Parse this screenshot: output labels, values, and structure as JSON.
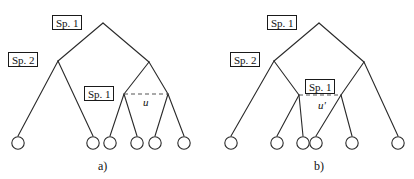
{
  "figure": {
    "background_color": "#ffffff",
    "stroke_color": "#2a2a2a",
    "dash_color": "#555555",
    "width": 414,
    "height": 179
  },
  "panels": [
    {
      "id": "a",
      "caption": "a)",
      "caption_x": 98,
      "caption_y": 160,
      "labels": [
        {
          "name": "sp1-root",
          "text": "Sp. 1",
          "x": 52,
          "y": 15,
          "w": 30,
          "h": 15
        },
        {
          "name": "sp2-left",
          "text": "Sp. 2",
          "x": 8,
          "y": 52,
          "w": 30,
          "h": 15
        },
        {
          "name": "sp1-inner",
          "text": "Sp. 1",
          "x": 84,
          "y": 86,
          "w": 30,
          "h": 15
        }
      ],
      "u_label": {
        "text": "u",
        "x": 143,
        "y": 97
      },
      "dashed_line": {
        "x1": 124,
        "y1": 94,
        "x2": 168,
        "y2": 94
      },
      "nodes": [
        {
          "name": "root",
          "x": 103,
          "y": 23
        },
        {
          "name": "left-internal",
          "x": 58,
          "y": 61
        },
        {
          "name": "right-internal",
          "x": 149,
          "y": 62
        },
        {
          "name": "clade-left",
          "x": 124,
          "y": 94
        },
        {
          "name": "clade-right",
          "x": 168,
          "y": 94
        }
      ],
      "leaves": [
        {
          "name": "leaf-1",
          "x": 18,
          "y": 143
        },
        {
          "name": "leaf-2",
          "x": 93,
          "y": 143
        },
        {
          "name": "leaf-3",
          "x": 110,
          "y": 143
        },
        {
          "name": "leaf-4",
          "x": 137,
          "y": 143
        },
        {
          "name": "leaf-5",
          "x": 155,
          "y": 143
        },
        {
          "name": "leaf-6",
          "x": 184,
          "y": 143
        }
      ],
      "edges": [
        {
          "x1": 103,
          "y1": 23,
          "x2": 58,
          "y2": 61
        },
        {
          "x1": 103,
          "y1": 23,
          "x2": 149,
          "y2": 62
        },
        {
          "x1": 58,
          "y1": 61,
          "x2": 18,
          "y2": 136
        },
        {
          "x1": 58,
          "y1": 61,
          "x2": 93,
          "y2": 136
        },
        {
          "x1": 149,
          "y1": 62,
          "x2": 124,
          "y2": 94
        },
        {
          "x1": 149,
          "y1": 62,
          "x2": 168,
          "y2": 94
        },
        {
          "x1": 124,
          "y1": 94,
          "x2": 110,
          "y2": 136
        },
        {
          "x1": 124,
          "y1": 94,
          "x2": 137,
          "y2": 136
        },
        {
          "x1": 168,
          "y1": 94,
          "x2": 155,
          "y2": 136
        },
        {
          "x1": 168,
          "y1": 94,
          "x2": 184,
          "y2": 136
        }
      ]
    },
    {
      "id": "b",
      "caption": "b)",
      "caption_x": 314,
      "caption_y": 160,
      "labels": [
        {
          "name": "sp1-root",
          "text": "Sp. 1",
          "x": 267,
          "y": 15,
          "w": 30,
          "h": 15
        },
        {
          "name": "sp2-left",
          "text": "Sp. 2",
          "x": 230,
          "y": 52,
          "w": 30,
          "h": 15
        },
        {
          "name": "sp1-inner",
          "text": "Sp. 1",
          "x": 305,
          "y": 79,
          "w": 30,
          "h": 15
        }
      ],
      "u_label": {
        "text": "u'",
        "x": 318,
        "y": 100
      },
      "dashed_line": {
        "x1": 299,
        "y1": 95,
        "x2": 341,
        "y2": 95
      },
      "nodes": [
        {
          "name": "root",
          "x": 319,
          "y": 23
        },
        {
          "name": "left-internal",
          "x": 274,
          "y": 61
        },
        {
          "name": "right-internal",
          "x": 364,
          "y": 62
        },
        {
          "name": "clade-left",
          "x": 299,
          "y": 95
        },
        {
          "name": "clade-right",
          "x": 341,
          "y": 95
        }
      ],
      "leaves": [
        {
          "name": "leaf-1",
          "x": 231,
          "y": 143
        },
        {
          "name": "leaf-2",
          "x": 277,
          "y": 143
        },
        {
          "name": "leaf-3",
          "x": 303,
          "y": 143
        },
        {
          "name": "leaf-4",
          "x": 316,
          "y": 143
        },
        {
          "name": "leaf-5",
          "x": 352,
          "y": 143
        },
        {
          "name": "leaf-6",
          "x": 398,
          "y": 143
        }
      ],
      "edges": [
        {
          "x1": 319,
          "y1": 23,
          "x2": 274,
          "y2": 61
        },
        {
          "x1": 319,
          "y1": 23,
          "x2": 364,
          "y2": 62
        },
        {
          "x1": 274,
          "y1": 61,
          "x2": 231,
          "y2": 136
        },
        {
          "x1": 274,
          "y1": 61,
          "x2": 299,
          "y2": 95
        },
        {
          "x1": 364,
          "y1": 62,
          "x2": 341,
          "y2": 95
        },
        {
          "x1": 364,
          "y1": 62,
          "x2": 398,
          "y2": 136
        },
        {
          "x1": 299,
          "y1": 95,
          "x2": 277,
          "y2": 136
        },
        {
          "x1": 299,
          "y1": 95,
          "x2": 303,
          "y2": 136
        },
        {
          "x1": 341,
          "y1": 95,
          "x2": 316,
          "y2": 136
        },
        {
          "x1": 341,
          "y1": 95,
          "x2": 352,
          "y2": 136
        }
      ]
    }
  ]
}
